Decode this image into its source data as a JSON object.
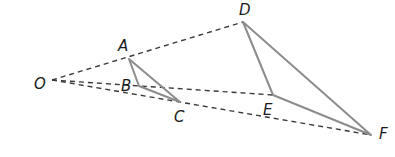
{
  "diagram": {
    "type": "dilation",
    "center": {
      "label": "O",
      "x": 52,
      "y": 80,
      "label_x": 34,
      "label_y": 89
    },
    "points": [
      {
        "label": "A",
        "x": 129,
        "y": 59,
        "label_x": 118,
        "label_y": 51
      },
      {
        "label": "B",
        "x": 139,
        "y": 86,
        "label_x": 121,
        "label_y": 91
      },
      {
        "label": "C",
        "x": 180,
        "y": 102,
        "label_x": 174,
        "label_y": 122
      },
      {
        "label": "D",
        "x": 243,
        "y": 22,
        "label_x": 239,
        "label_y": 15
      },
      {
        "label": "E",
        "x": 273,
        "y": 95,
        "label_x": 263,
        "label_y": 115
      },
      {
        "label": "F",
        "x": 371,
        "y": 135,
        "label_x": 379,
        "label_y": 139
      }
    ],
    "small_triangle": [
      "A",
      "B",
      "C"
    ],
    "large_triangle": [
      "D",
      "E",
      "F"
    ],
    "dashed_rays": [
      [
        "O",
        "D"
      ],
      [
        "O",
        "E"
      ],
      [
        "O",
        "F"
      ]
    ],
    "colors": {
      "triangle_stroke": "#8c8c8c",
      "ray_stroke": "#3a3a3a",
      "label": "#1a1a1a"
    }
  },
  "labels": {
    "O": "O",
    "A": "A",
    "B": "B",
    "C": "C",
    "D": "D",
    "E": "E",
    "F": "F"
  }
}
